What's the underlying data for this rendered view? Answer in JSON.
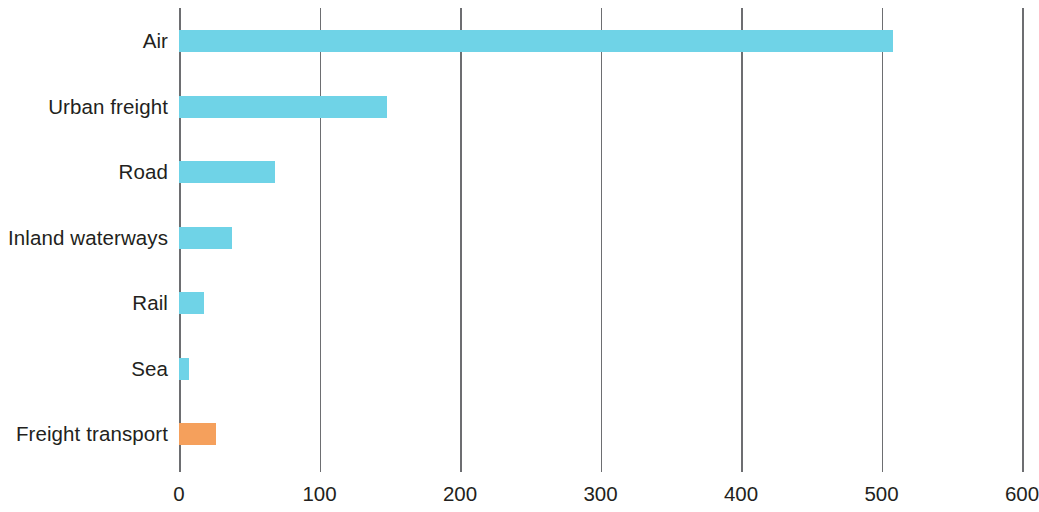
{
  "chart_data": {
    "type": "bar",
    "orientation": "horizontal",
    "title": "",
    "subtitle": "",
    "xlabel": "",
    "ylabel": "",
    "xlim": [
      0,
      600
    ],
    "ylim": null,
    "grid": true,
    "grid_axis": "x",
    "legend": false,
    "legend_position": "none",
    "categories": [
      "Air",
      "Urban freight",
      "Road",
      "Inland waterways",
      "Rail",
      "Sea",
      "Freight transport"
    ],
    "values": [
      508,
      148,
      68,
      38,
      18,
      7,
      26
    ],
    "xticks": [
      0,
      100,
      200,
      300,
      400,
      500,
      600
    ],
    "xtick_labels": [
      "0",
      "100",
      "200",
      "300",
      "400",
      "500",
      "600"
    ],
    "bar_colors": [
      "#6fd3e7",
      "#6fd3e7",
      "#6fd3e7",
      "#6fd3e7",
      "#6fd3e7",
      "#6fd3e7",
      "#f5a05c"
    ],
    "series": [
      {
        "name": "value",
        "values": [
          508,
          148,
          68,
          38,
          18,
          7,
          26
        ]
      }
    ],
    "annotations": []
  },
  "style": {
    "accent_blue": "#6fd3e7",
    "accent_orange": "#f5a05c",
    "axis_color": "#6d6e71",
    "text_color": "#231f20",
    "background": "#ffffff"
  }
}
